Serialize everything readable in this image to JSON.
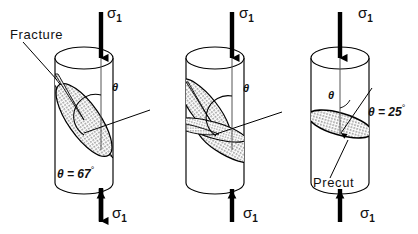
{
  "figure": {
    "type": "line-drawing",
    "background_color": "#ffffff",
    "line_color": "#000000",
    "hatch_fill_color": "#ffffff"
  },
  "specimens": [
    {
      "id": "specimen-left",
      "name": "fracture-67",
      "top_stress_label": "σ",
      "top_stress_sub": "1",
      "bottom_stress_label": "σ",
      "bottom_stress_sub": "1",
      "callout_label": "Fracture",
      "theta_symbol": "θ",
      "angle_text_prefix": "θ = 67",
      "angle_value": 67,
      "angle_unit": "°",
      "surface_count": 1,
      "surface_description": "single stippled inclined fracture ellipse"
    },
    {
      "id": "specimen-middle",
      "name": "fracture-multiple",
      "top_stress_label": "σ",
      "top_stress_sub": "1",
      "bottom_stress_label": "σ",
      "bottom_stress_sub": "1",
      "callout_label": "",
      "theta_symbol": "θ",
      "angle_text_prefix": "",
      "angle_value": null,
      "angle_unit": "",
      "surface_count": 3,
      "surface_description": "multiple intersecting stippled fracture planes"
    },
    {
      "id": "specimen-right",
      "name": "precut-25",
      "top_stress_label": "σ",
      "top_stress_sub": "1",
      "bottom_stress_label": "σ",
      "bottom_stress_sub": "1",
      "callout_label": "Precut",
      "theta_symbol": "θ",
      "angle_text_prefix": "θ = 25",
      "angle_value": 25,
      "angle_unit": "°",
      "surface_count": 1,
      "surface_description": "shallow stippled precut ellipse"
    }
  ],
  "labels": {
    "fracture": "Fracture",
    "precut": "Precut",
    "theta": "θ",
    "theta_67": "θ = 67",
    "theta_25": "θ = 25",
    "degree": "°",
    "sigma": "σ",
    "sigma_sub": "1"
  }
}
